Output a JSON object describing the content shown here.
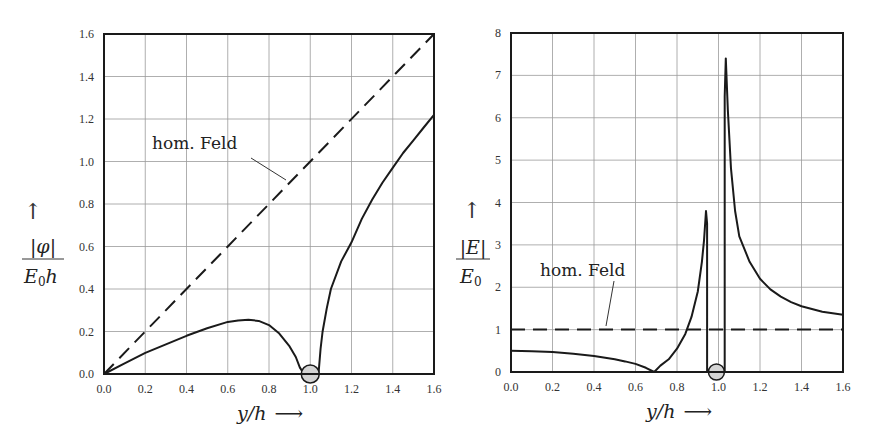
{
  "chart_data": [
    {
      "type": "line",
      "title": "",
      "xlabel": "y/h →",
      "ylabel": "|φ| / (E₀h) ↑",
      "xlim": [
        0.0,
        1.6
      ],
      "ylim": [
        0.0,
        1.6
      ],
      "grid": true,
      "x_ticks": [
        "0.0",
        "0.2",
        "0.4",
        "0.6",
        "0.8",
        "1.0",
        "1.2",
        "1.4",
        "1.6"
      ],
      "y_ticks": [
        "0.0",
        "0.2",
        "0.4",
        "0.6",
        "0.8",
        "1.0",
        "1.2",
        "1.4",
        "1.6"
      ],
      "annotations": [
        {
          "text": "hom. Feld",
          "points_to": "dashed line near y/h=0.88"
        }
      ],
      "marker": {
        "shape": "circle",
        "x": 1.0,
        "y": 0.0,
        "fill": "#d4d4d4"
      },
      "series": [
        {
          "name": "hom. Feld",
          "style": "dashed",
          "x": [
            0.0,
            1.6
          ],
          "y": [
            0.0,
            1.6
          ]
        },
        {
          "name": "|phi| with conductor",
          "style": "solid",
          "segments": [
            {
              "x": [
                0.0,
                0.1,
                0.2,
                0.3,
                0.4,
                0.5,
                0.6,
                0.65,
                0.7,
                0.75,
                0.8,
                0.85,
                0.9,
                0.93,
                0.95,
                0.97
              ],
              "y": [
                0.0,
                0.05,
                0.1,
                0.14,
                0.18,
                0.215,
                0.245,
                0.252,
                0.255,
                0.25,
                0.23,
                0.19,
                0.13,
                0.08,
                0.03,
                0.0
              ]
            },
            {
              "x": [
                1.04,
                1.05,
                1.06,
                1.08,
                1.1,
                1.15,
                1.2,
                1.25,
                1.3,
                1.35,
                1.4,
                1.45,
                1.5,
                1.55,
                1.6
              ],
              "y": [
                0.0,
                0.12,
                0.2,
                0.31,
                0.4,
                0.53,
                0.62,
                0.73,
                0.82,
                0.9,
                0.97,
                1.04,
                1.1,
                1.16,
                1.22
              ]
            }
          ]
        }
      ]
    },
    {
      "type": "line",
      "title": "",
      "xlabel": "y/h →",
      "ylabel": "|E| / E₀ ↑",
      "xlim": [
        0.0,
        1.6
      ],
      "ylim": [
        0,
        8
      ],
      "grid": true,
      "x_ticks": [
        "0.0",
        "0.2",
        "0.4",
        "0.6",
        "0.8",
        "1.0",
        "1.2",
        "1.4",
        "1.6"
      ],
      "y_ticks": [
        "0",
        "1",
        "2",
        "3",
        "4",
        "5",
        "6",
        "7",
        "8"
      ],
      "annotations": [
        {
          "text": "hom. Feld",
          "points_to": "dashed line near y/h=0.45"
        }
      ],
      "marker": {
        "shape": "circle",
        "x": 0.99,
        "y": 0.0,
        "fill": "#d4d4d4"
      },
      "series": [
        {
          "name": "hom. Feld",
          "style": "dashed",
          "x": [
            0.0,
            1.6
          ],
          "y": [
            1.0,
            1.0
          ]
        },
        {
          "name": "|E| with conductor",
          "style": "solid",
          "segments": [
            {
              "x": [
                0.0,
                0.1,
                0.2,
                0.3,
                0.4,
                0.5,
                0.55,
                0.6,
                0.65,
                0.69
              ],
              "y": [
                0.5,
                0.49,
                0.47,
                0.43,
                0.38,
                0.3,
                0.25,
                0.19,
                0.1,
                0.0
              ]
            },
            {
              "x": [
                0.69,
                0.72,
                0.76,
                0.8,
                0.84,
                0.87,
                0.9,
                0.92,
                0.93,
                0.94,
                0.945,
                0.945
              ],
              "y": [
                0.0,
                0.15,
                0.3,
                0.55,
                0.9,
                1.3,
                1.9,
                2.6,
                3.1,
                3.8,
                3.5,
                0.0
              ]
            },
            {
              "x": [
                1.03,
                1.03,
                1.035,
                1.045,
                1.06,
                1.08,
                1.1,
                1.15,
                1.2,
                1.25,
                1.3,
                1.35,
                1.4,
                1.5,
                1.6
              ],
              "y": [
                0.0,
                6.5,
                7.4,
                6.2,
                4.8,
                3.8,
                3.2,
                2.6,
                2.2,
                1.95,
                1.78,
                1.65,
                1.55,
                1.42,
                1.35
              ]
            }
          ]
        }
      ]
    }
  ],
  "left": {
    "ylabel_num": "|φ|",
    "ylabel_den_main": "E",
    "ylabel_den_sub": "0",
    "ylabel_den_tail": "h",
    "xlabel": "y/h",
    "annotation": "hom. Feld"
  },
  "right": {
    "ylabel_num": "|E|",
    "ylabel_den_main": "E",
    "ylabel_den_sub": "0",
    "xlabel": "y/h",
    "annotation": "hom. Feld"
  },
  "arrows": {
    "up": "↑",
    "right": "⟶"
  }
}
